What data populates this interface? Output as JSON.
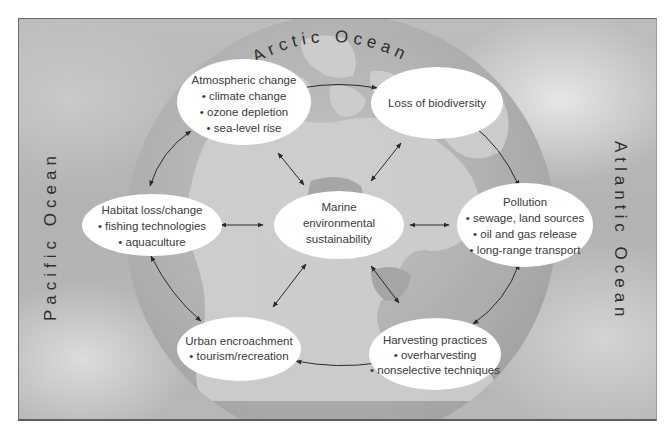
{
  "diagram": {
    "center_node": {
      "id": "marine",
      "lines": [
        "Marine",
        "environmental",
        "sustainability"
      ]
    },
    "outer_nodes": [
      {
        "id": "atmospheric",
        "title": "Atmospheric change",
        "bullets": [
          "climate change",
          "ozone depletion",
          "sea-level rise"
        ]
      },
      {
        "id": "biodiversity",
        "title": "Loss of biodiversity",
        "bullets": []
      },
      {
        "id": "pollution",
        "title": "Pollution",
        "bullets": [
          "sewage, land sources",
          "oil and gas release",
          "long-range transport"
        ]
      },
      {
        "id": "harvesting",
        "title": "Harvesting practices",
        "bullets": [
          "overharvesting",
          "nonselective techniques"
        ]
      },
      {
        "id": "urban",
        "title": "Urban encroachment",
        "bullets": [
          "tourism/recreation"
        ]
      },
      {
        "id": "habitat",
        "title": "Habitat loss/change",
        "bullets": [
          "fishing technologies",
          "aquaculture"
        ]
      }
    ],
    "ocean_labels": {
      "arctic": "Arctic Ocean",
      "pacific": "Pacific Ocean",
      "atlantic": "Atlantic Ocean"
    },
    "edges": [
      {
        "from": "atmospheric",
        "to": "biodiversity",
        "type": "bidirectional-curved"
      },
      {
        "from": "biodiversity",
        "to": "pollution",
        "type": "bidirectional-curved"
      },
      {
        "from": "pollution",
        "to": "harvesting",
        "type": "bidirectional-curved"
      },
      {
        "from": "harvesting",
        "to": "urban",
        "type": "bidirectional-curved"
      },
      {
        "from": "urban",
        "to": "habitat",
        "type": "bidirectional-curved"
      },
      {
        "from": "habitat",
        "to": "atmospheric",
        "type": "bidirectional-curved"
      },
      {
        "from": "marine",
        "to": "atmospheric",
        "type": "bidirectional"
      },
      {
        "from": "marine",
        "to": "biodiversity",
        "type": "bidirectional"
      },
      {
        "from": "marine",
        "to": "pollution",
        "type": "bidirectional"
      },
      {
        "from": "marine",
        "to": "harvesting",
        "type": "bidirectional"
      },
      {
        "from": "marine",
        "to": "urban",
        "type": "bidirectional"
      },
      {
        "from": "marine",
        "to": "habitat",
        "type": "bidirectional"
      }
    ],
    "colors": {
      "node_fill": "#ffffff",
      "text": "#3a3a3a",
      "arrow": "#2a2a2a",
      "globe_ocean": "#a9a9a9",
      "globe_land": "#cfcfcf",
      "background": "#b8b8b8"
    }
  }
}
